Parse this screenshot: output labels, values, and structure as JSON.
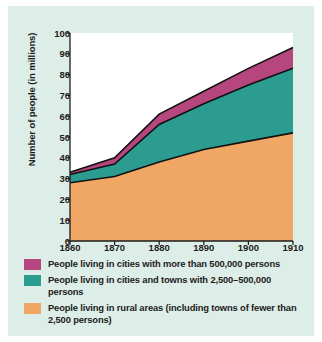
{
  "figure": {
    "background_color": "#dceee7",
    "plot_background_color": "#ffffff",
    "axis_color": "#1c1c1c"
  },
  "axes": {
    "ylabel": "Number of people (in millions)",
    "yticks": [
      "0",
      "10",
      "20",
      "30",
      "40",
      "50",
      "60",
      "70",
      "80",
      "90",
      "100"
    ],
    "xticks": [
      "1860",
      "1870",
      "1880",
      "1890",
      "1900",
      "1910"
    ]
  },
  "legend": {
    "items": [
      {
        "color": "#b5477e",
        "label": "People living in cities with more than 500,000 persons"
      },
      {
        "color": "#2c9c91",
        "label": "People living in cities and towns with 2,500–500,000 persons"
      },
      {
        "color": "#f0a766",
        "label": "People living in rural areas (including towns of fewer than 2,500 persons)"
      }
    ]
  },
  "chart_data": {
    "type": "area",
    "title": "",
    "xlabel": "",
    "ylabel": "Number of people (in millions)",
    "stacked": true,
    "grid": false,
    "legend_position": "below",
    "xlim": [
      1860,
      1910
    ],
    "ylim": [
      0,
      100
    ],
    "x": [
      1860,
      1870,
      1880,
      1890,
      1900,
      1910
    ],
    "categories": [
      "1860",
      "1870",
      "1880",
      "1890",
      "1900",
      "1910"
    ],
    "series": [
      {
        "name": "People living in rural areas (including towns of fewer than 2,500 persons)",
        "color": "#f0a766",
        "values": [
          28,
          31,
          38,
          44,
          48,
          52
        ]
      },
      {
        "name": "People living in cities and towns with 2,500–500,000 persons",
        "color": "#2c9c91",
        "values": [
          4,
          6,
          18,
          22,
          27,
          31
        ]
      },
      {
        "name": "People living in cities with more than 500,000 persons",
        "color": "#b5477e",
        "values": [
          1,
          3,
          5,
          6,
          8,
          10
        ]
      }
    ],
    "cumulative_tops": {
      "rural": [
        28,
        31,
        38,
        44,
        48,
        52
      ],
      "rural_plus_towns": [
        32,
        37,
        56,
        66,
        75,
        83
      ],
      "total": [
        33,
        40,
        61,
        72,
        83,
        93
      ]
    }
  }
}
